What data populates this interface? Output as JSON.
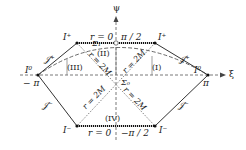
{
  "diagram": {
    "axes": {
      "vertical": "ψ",
      "horizontal": "ξ"
    },
    "labels": {
      "I_plus_left": "I⁺",
      "I_plus_right": "I⁺",
      "I_minus_left": "I⁻",
      "I_minus_right": "I⁻",
      "I0_left": "I⁰",
      "I0_right": "I⁰",
      "scri_plus_left": "𝒥⁺",
      "scri_plus_right": "𝒥⁺",
      "scri_minus_left": "𝒥⁻",
      "scri_minus_right": "𝒥⁻",
      "top_singularity": "r = 0",
      "top_value": "π / 2",
      "bottom_singularity": "r = 0",
      "bottom_value": "−π / 2",
      "minus_pi": "− π",
      "pi": "π",
      "region_I": "(I)",
      "region_II": "(II)",
      "region_III": "(III)",
      "region_IV": "(IV)",
      "sigma1": "Σ₁",
      "sigma0": "Σ₀",
      "horizon_label": "r = 2M"
    }
  }
}
